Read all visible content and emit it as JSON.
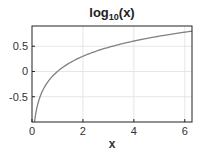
{
  "chart_data": {
    "type": "line",
    "title": "log10(x)",
    "title_parts": {
      "base": "log",
      "sub": "10",
      "rest": "(x)"
    },
    "xlabel": "x",
    "ylabel": "",
    "xlim": [
      0,
      6.2832
    ],
    "ylim": [
      -1,
      0.9
    ],
    "xticks": [
      0,
      2,
      4,
      6
    ],
    "xtick_labels": [
      "0",
      "2",
      "4",
      "6"
    ],
    "yticks": [
      -0.5,
      0,
      0.5
    ],
    "ytick_labels": [
      "-0.5",
      "0",
      "0.5"
    ],
    "grid": true,
    "legend": null,
    "series": [
      {
        "name": "log10(x)",
        "color": "#808080",
        "function": "log10(x)",
        "x": [
          0.1,
          0.2,
          0.3,
          0.5,
          0.75,
          1,
          1.5,
          2,
          2.5,
          3,
          3.5,
          4,
          4.5,
          5,
          5.5,
          6,
          6.2832
        ],
        "y": [
          -1,
          -0.699,
          -0.523,
          -0.301,
          -0.125,
          0,
          0.176,
          0.301,
          0.398,
          0.477,
          0.544,
          0.602,
          0.653,
          0.699,
          0.74,
          0.778,
          0.798
        ]
      }
    ]
  }
}
